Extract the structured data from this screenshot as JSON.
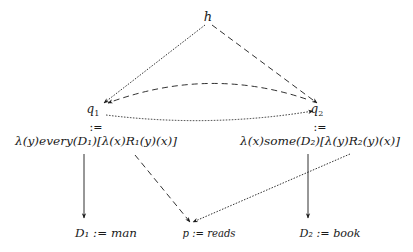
{
  "diagram": {
    "nodes": {
      "h": {
        "label": "h"
      },
      "q1": {
        "label": "q",
        "sub": "1",
        "def": ":=",
        "formula": "λ(y)every(D₁)[λ(x)R₁(y)(x)]"
      },
      "q2": {
        "label": "q",
        "sub": "2",
        "def": ":=",
        "formula": "λ(x)some(D₂)[λ(y)R₂(y)(x)]"
      },
      "d1": {
        "text": "D₁ := man"
      },
      "p": {
        "text": "p := reads"
      },
      "d2": {
        "text": "D₂ := book"
      }
    },
    "edges": [
      {
        "from": "h",
        "to": "q1",
        "style": "dotted"
      },
      {
        "from": "h",
        "to": "q2",
        "style": "dashed"
      },
      {
        "from": "q2",
        "to": "q1",
        "style": "dashed",
        "shape": "arc"
      },
      {
        "from": "q1",
        "to": "q2",
        "style": "dotted",
        "shape": "arc"
      },
      {
        "from": "q1-formula",
        "to": "d1",
        "style": "solid"
      },
      {
        "from": "q1-formula",
        "to": "p",
        "style": "dashed"
      },
      {
        "from": "q2-formula",
        "to": "p",
        "style": "dotted"
      },
      {
        "from": "q2-formula",
        "to": "d2",
        "style": "solid"
      }
    ],
    "colors": {
      "ink": "#1a1a1a",
      "background": "#ffffff"
    }
  }
}
